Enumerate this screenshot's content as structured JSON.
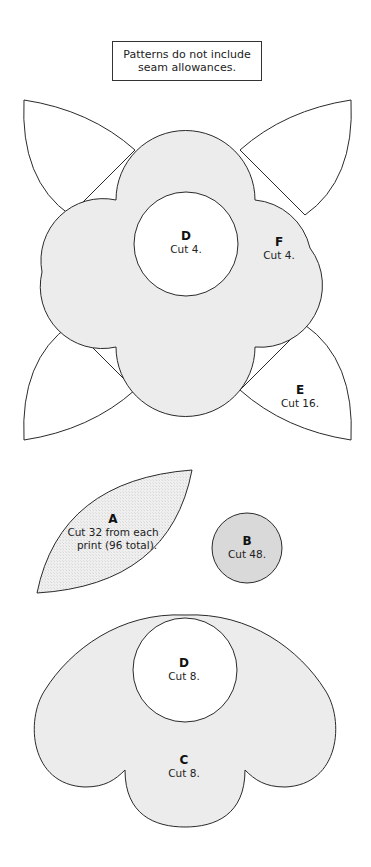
{
  "note": {
    "line1": "Patterns do not include",
    "line2": "seam allowances."
  },
  "colors": {
    "outline": "#2a2a2a",
    "light_fill": "#ececec",
    "medium_fill": "#d9d9d9",
    "white_fill": "#ffffff"
  },
  "pieces": {
    "flower": {
      "center": {
        "letter": "D",
        "instruction": "Cut 4."
      },
      "petals": {
        "letter": "F",
        "instruction": "Cut 4."
      },
      "leaf": {
        "letter": "E",
        "instruction": "Cut 16."
      }
    },
    "leaf_a": {
      "letter": "A",
      "instruction_line1": "Cut 32 from each",
      "instruction_line2": "print (96 total)."
    },
    "circle_b": {
      "letter": "B",
      "instruction": "Cut 48."
    },
    "half_flower": {
      "center": {
        "letter": "D",
        "instruction": "Cut 8."
      },
      "body": {
        "letter": "C",
        "instruction": "Cut 8."
      }
    }
  }
}
